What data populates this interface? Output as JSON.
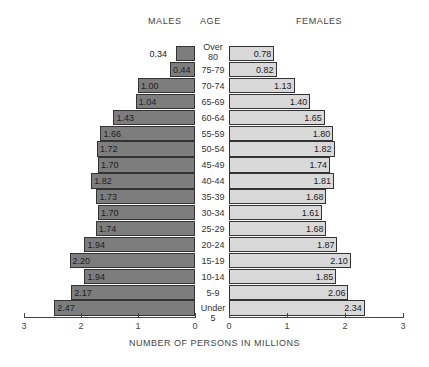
{
  "headers": {
    "males": "MALES",
    "age": "AGE",
    "females": "FEMALES"
  },
  "xlabel": "NUMBER OF PERSONS IN MILLIONS",
  "ticks": {
    "male": [
      "3",
      "2",
      "1",
      "0"
    ],
    "female": [
      "0",
      "1",
      "2",
      "3"
    ]
  },
  "colors": {
    "male_bar": "#7d7d7d",
    "female_bar": "#d9d9d9",
    "outline": "#333333"
  },
  "chart_data": {
    "type": "bar",
    "title": "",
    "subtype": "population-pyramid",
    "xlabel": "NUMBER OF PERSONS IN MILLIONS",
    "ylabel": "AGE",
    "xlim": [
      0,
      3
    ],
    "categories": [
      "Over 80",
      "75-79",
      "70-74",
      "65-69",
      "60-64",
      "55-59",
      "50-54",
      "45-49",
      "40-44",
      "35-39",
      "30-34",
      "25-29",
      "20-24",
      "15-19",
      "10-14",
      "5-9",
      "Under 5"
    ],
    "series": [
      {
        "name": "MALES",
        "values": [
          0.34,
          0.44,
          1.0,
          1.04,
          1.43,
          1.66,
          1.72,
          1.7,
          1.82,
          1.73,
          1.7,
          1.74,
          1.94,
          2.2,
          1.94,
          2.17,
          2.47
        ]
      },
      {
        "name": "FEMALES",
        "values": [
          0.78,
          0.82,
          1.13,
          1.4,
          1.65,
          1.8,
          1.82,
          1.74,
          1.81,
          1.68,
          1.61,
          1.68,
          1.87,
          2.1,
          1.85,
          2.06,
          2.34
        ]
      }
    ],
    "value_labels": {
      "male": [
        "0.34",
        "0.44",
        "1.00",
        "1.04",
        "1.43",
        "1.66",
        "1.72",
        "1.70",
        "1.82",
        "1.73",
        "1.70",
        "1.74",
        "1.94",
        "2.20",
        "1.94",
        "2.17",
        "2.47"
      ],
      "female": [
        "0.78",
        "0.82",
        "1.13",
        "1.40",
        "1.65",
        "1.80",
        "1.82",
        "1.74",
        "1.81",
        "1.68",
        "1.61",
        "1.68",
        "1.87",
        "2.10",
        "1.85",
        "2.06",
        "2.34"
      ]
    },
    "age_labels": [
      "Over\n80",
      "75-79",
      "70-74",
      "65-69",
      "60-64",
      "55-59",
      "50-54",
      "45-49",
      "40-44",
      "35-39",
      "30-34",
      "25-29",
      "20-24",
      "15-19",
      "10-14",
      "5-9",
      "Under 5"
    ],
    "grid": false,
    "legend": "none"
  }
}
